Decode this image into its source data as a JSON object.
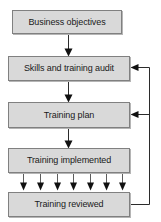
{
  "diagram": {
    "type": "flowchart",
    "background_color": "#ffffff",
    "node_fill_color": "#d9d9d9",
    "node_border_color": "#808080",
    "arrow_color": "#111111",
    "nodes": [
      {
        "id": "business-objectives",
        "label": "Business objectives",
        "x": 12,
        "y": 10,
        "w": 110,
        "h": 24
      },
      {
        "id": "skills-training-audit",
        "label": "Skills and training audit",
        "x": 8,
        "y": 56,
        "w": 122,
        "h": 25
      },
      {
        "id": "training-plan",
        "label": "Training plan",
        "x": 8,
        "y": 102,
        "w": 122,
        "h": 26
      },
      {
        "id": "training-implemented",
        "label": "Training implemented",
        "x": 8,
        "y": 148,
        "w": 122,
        "h": 25
      },
      {
        "id": "training-reviewed",
        "label": "Training reviewed",
        "x": 8,
        "y": 192,
        "w": 122,
        "h": 25
      }
    ],
    "edges": [
      {
        "id": "edge-objectives-to-audit",
        "from": "business-objectives",
        "to": "skills-training-audit",
        "kind": "down-arrow"
      },
      {
        "id": "edge-audit-to-plan",
        "from": "skills-training-audit",
        "to": "training-plan",
        "kind": "down-arrow"
      },
      {
        "id": "edge-plan-to-implemented",
        "from": "training-plan",
        "to": "training-implemented",
        "kind": "down-arrow"
      },
      {
        "id": "edge-implemented-to-reviewed",
        "from": "training-implemented",
        "to": "training-reviewed",
        "kind": "multi-down-arrows",
        "arrow_count": 7
      },
      {
        "id": "edge-reviewed-to-plan",
        "from": "training-reviewed",
        "to": "training-plan",
        "kind": "feedback-left-arrow"
      },
      {
        "id": "edge-reviewed-to-audit",
        "from": "training-reviewed",
        "to": "skills-training-audit",
        "kind": "feedback-left-arrow"
      }
    ]
  }
}
